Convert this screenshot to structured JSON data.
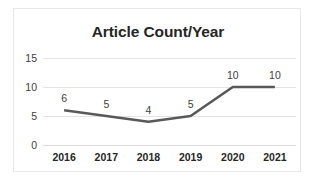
{
  "chart_data": {
    "type": "line",
    "title": "Article Count/Year",
    "xlabel": "",
    "ylabel": "",
    "categories": [
      "2016",
      "2017",
      "2018",
      "2019",
      "2020",
      "2021"
    ],
    "values": [
      6,
      5,
      4,
      5,
      10,
      10
    ],
    "data_labels": [
      "6",
      "5",
      "4",
      "5",
      "10",
      "10"
    ],
    "yticks": [
      "15",
      "10",
      "5",
      "0"
    ],
    "ytick_values": [
      15,
      10,
      5,
      0
    ],
    "ylim": [
      0,
      15
    ],
    "grid": true,
    "legend": false,
    "legend_position": "none",
    "series": [
      {
        "name": "Article Count",
        "values": [
          6,
          5,
          4,
          5,
          10,
          10
        ],
        "color": "#595959"
      }
    ],
    "colors": {
      "line": "#595959",
      "gridline": "#e4e4e4",
      "border": "#e8e8e8",
      "title_text": "#262626",
      "tick_text": "#404040",
      "background": "#ffffff"
    }
  }
}
